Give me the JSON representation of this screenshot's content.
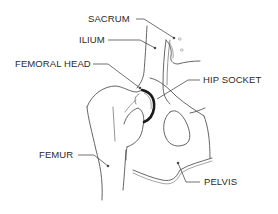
{
  "diagram": {
    "type": "anatomical illustration",
    "labels": {
      "sacrum": "SACRUM",
      "ilium": "ILIUM",
      "femoral_head": "FEMORAL HEAD",
      "hip_socket": "HIP SOCKET",
      "femur": "FEMUR",
      "pelvis": "PELVIS"
    },
    "colors": {
      "line": "#555555",
      "label": "#2a2a2a",
      "socket": "#1a1a1a",
      "background": "#ffffff"
    }
  }
}
